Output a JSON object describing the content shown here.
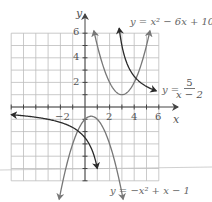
{
  "axes": {
    "x_label": "x",
    "y_label": "y",
    "x_ticks": [
      "−2",
      "2",
      "4",
      "6"
    ],
    "y_ticks": [
      "2",
      "4",
      "6"
    ]
  },
  "equations": {
    "parabola_up": "y = x² − 6x + 10",
    "rational_prefix": "y =",
    "rational_num": "5",
    "rational_den": "x − 2",
    "parabola_down": "y = −x² + x − 1"
  },
  "colors": {
    "grid": "#b8b8b8",
    "axis": "#444444",
    "parabola": "#777777",
    "rational": "#2a2a2a"
  },
  "chart_data": {
    "type": "line",
    "title": "",
    "xlabel": "x",
    "ylabel": "y",
    "xlim": [
      -6,
      6
    ],
    "ylim": [
      -6,
      6
    ],
    "grid": true,
    "series": [
      {
        "name": "y = x^2 - 6x + 10",
        "function": "x^2 - 6x + 10",
        "domain": [
          0.75,
          5.25
        ],
        "vertex": [
          3,
          1
        ]
      },
      {
        "name": "y = 5/(x - 2)",
        "function": "5/(x-2)",
        "branches": [
          [
            -6,
            1
          ],
          [
            2.8,
            5.7
          ]
        ],
        "asymptote_x": 2
      },
      {
        "name": "y = -x^2 + x - 1",
        "function": "-x^2 + x - 1",
        "domain": [
          -2,
          3
        ],
        "vertex": [
          0.5,
          -0.75
        ]
      }
    ]
  }
}
